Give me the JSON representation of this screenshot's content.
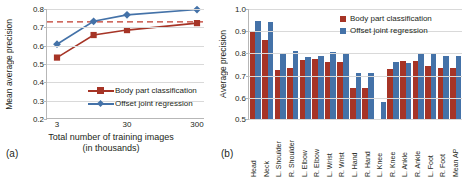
{
  "colors": {
    "body_part": "#A63426",
    "offset_joint": "#4472A8",
    "dashed_ref": "#C0392B",
    "grid": "#D9D9D9",
    "axis": "#B7B7B7",
    "text": "#231F20"
  },
  "panel_a": {
    "tag": "(a)",
    "ylabel": "Mean average precision",
    "xlabel_line1": "Total number of training images",
    "xlabel_line2": "(in thousands)",
    "legend": [
      {
        "label": "Body part classification",
        "color": "#A63426",
        "marker": "square"
      },
      {
        "label": "Offset joint regression",
        "color": "#4472A8",
        "marker": "diamond"
      }
    ]
  },
  "panel_b": {
    "tag": "(b)",
    "ylabel": "Average precision",
    "legend": [
      {
        "label": "Body part classification",
        "color": "#A63426"
      },
      {
        "label": "Offset joint regression",
        "color": "#4472A8"
      }
    ]
  },
  "chart_data": [
    {
      "type": "line",
      "panel": "(a)",
      "title": "",
      "xlabel": "Total number of training images (in thousands)",
      "ylabel": "Mean average precision",
      "x": [
        3,
        10,
        30,
        300
      ],
      "xtick_labels": [
        "3",
        "30",
        "300"
      ],
      "xtick_values": [
        3,
        30,
        300
      ],
      "xscale": "log",
      "ylim": [
        0.2,
        0.8
      ],
      "ytick_labels": [
        "0.2",
        "0.3",
        "0.4",
        "0.5",
        "0.6",
        "0.7",
        "0.8"
      ],
      "ytick_values": [
        0.2,
        0.3,
        0.4,
        0.5,
        0.6,
        0.7,
        0.8
      ],
      "grid": true,
      "legend_position": "lower-right-inside",
      "annotations": [
        {
          "type": "hline",
          "value": 0.73,
          "style": "dashed",
          "color": "#C0392B"
        }
      ],
      "series": [
        {
          "name": "Body part classification",
          "color": "#A63426",
          "marker": "square",
          "values": [
            0.535,
            0.658,
            0.685,
            0.723
          ]
        },
        {
          "name": "Offset joint regression",
          "color": "#4472A8",
          "marker": "diamond",
          "values": [
            0.608,
            0.733,
            0.768,
            0.797
          ]
        }
      ]
    },
    {
      "type": "bar",
      "panel": "(b)",
      "title": "",
      "xlabel": "",
      "ylabel": "Average precision",
      "ylim": [
        0.5,
        1.0
      ],
      "ytick_labels": [
        "0.5",
        "0.6",
        "0.7",
        "0.8",
        "0.9",
        "1.0"
      ],
      "ytick_values": [
        0.5,
        0.6,
        0.7,
        0.8,
        0.9,
        1.0
      ],
      "grid": true,
      "legend_position": "top-right-inside",
      "categories": [
        "Head",
        "Neck",
        "L. Shoulder",
        "R. Shoulder",
        "L. Elbow",
        "R. Elbow",
        "L. Wrist",
        "R. Wrist",
        "L. Hand",
        "R. Hand",
        "L. Knee",
        "R. Knee",
        "L. Ankle",
        "R. Ankle",
        "L. Foot",
        "R. Foot",
        "Mean AP"
      ],
      "series": [
        {
          "name": "Body part classification",
          "color": "#A63426",
          "values": [
            0.9,
            0.86,
            0.725,
            0.735,
            0.77,
            0.775,
            0.76,
            0.76,
            0.645,
            0.645,
            0.5,
            0.73,
            0.765,
            0.765,
            0.745,
            0.735,
            0.735
          ]
        },
        {
          "name": "Offset joint regression",
          "color": "#4472A8",
          "values": [
            0.948,
            0.94,
            0.8,
            0.812,
            0.782,
            0.788,
            0.808,
            0.8,
            0.712,
            0.71,
            0.58,
            0.762,
            0.755,
            0.8,
            0.802,
            0.79,
            0.788
          ]
        }
      ]
    }
  ]
}
